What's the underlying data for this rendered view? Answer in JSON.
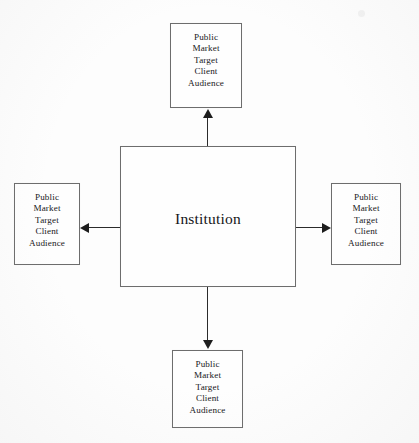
{
  "diagram": {
    "center": {
      "label": "Institution"
    },
    "satellite_text": "Public\nMarket\nTarget\nClient\nAudience",
    "nodes": [
      {
        "id": "top",
        "label": "Public\nMarket\nTarget\nClient\nAudience"
      },
      {
        "id": "left",
        "label": "Public\nMarket\nTarget\nClient\nAudience"
      },
      {
        "id": "right",
        "label": "Public\nMarket\nTarget\nClient\nAudience"
      },
      {
        "id": "bottom",
        "label": "Public\nMarket\nTarget\nClient\nAudience"
      }
    ],
    "arrows": [
      {
        "id": "up",
        "from": "center",
        "to": "top",
        "direction": "up"
      },
      {
        "id": "down",
        "from": "center",
        "to": "bottom",
        "direction": "down"
      },
      {
        "id": "left",
        "from": "center",
        "to": "left",
        "direction": "left"
      },
      {
        "id": "right",
        "from": "center",
        "to": "right",
        "direction": "right"
      }
    ],
    "artifact": {
      "text": "",
      "note": "faint scanner smudge"
    },
    "colors": {
      "background": "#fdfdfd",
      "box_border": "#6d6d6d",
      "text": "#17171a",
      "arrow": "#1d1d1d"
    }
  }
}
